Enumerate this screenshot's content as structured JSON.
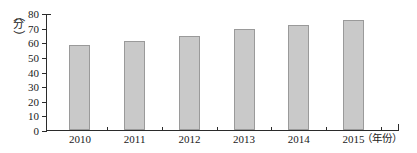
{
  "chart_data": {
    "type": "bar",
    "title": "",
    "subtitle": "",
    "xlabel": "（年份）",
    "ylabel": "（分）",
    "categories": [
      "2010",
      "2011",
      "2012",
      "2013",
      "2014",
      "2015"
    ],
    "values": [
      58,
      61,
      64,
      69,
      72,
      75
    ],
    "series": [
      {
        "name": "",
        "values": [
          58,
          61,
          64,
          69,
          72,
          75
        ]
      }
    ],
    "ylim": [
      0,
      80
    ],
    "ytick_values": [
      0,
      10,
      20,
      30,
      40,
      50,
      60,
      70,
      80
    ],
    "ytick_labels": [
      "0",
      "10",
      "20",
      "30",
      "40",
      "50",
      "60",
      "70",
      "80"
    ],
    "ytick_interval": 10,
    "grid": false,
    "legend": null,
    "legend_position": "none",
    "annotations": [],
    "bar_color": "#c9c9c9",
    "bar_border_color": "#9a9a9a",
    "axis_color": "#2b2b2b",
    "background_color": "#ffffff"
  },
  "axis_unit_y": {
    "open_paren": "（",
    "glyph": "分",
    "close_paren": "）"
  }
}
